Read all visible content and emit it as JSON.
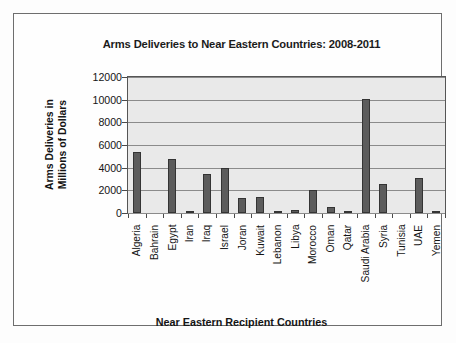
{
  "chart_data": {
    "type": "bar",
    "title": "Arms Deliveries to Near Eastern Countries: 2008-2011",
    "xlabel": "Near Eastern Recipient Countries",
    "ylabel": "Arms Deliveries in Millions of Dollars",
    "ylabel_line1": "Arms Deliveries in",
    "ylabel_line2": "Millions of Dollars",
    "ylim": [
      0,
      12000
    ],
    "ytick_step": 2000,
    "yticks": [
      "12000",
      "10000",
      "8000",
      "6000",
      "4000",
      "2000",
      "0"
    ],
    "ytick_values": [
      12000,
      10000,
      8000,
      6000,
      4000,
      2000,
      0
    ],
    "grid": true,
    "grid_axis": "y",
    "legend": false,
    "categories": [
      "Algeria",
      "Bahrain",
      "Egypt",
      "Iran",
      "Iraq",
      "Israel",
      "Joran",
      "Kuwait",
      "Lebanon",
      "Libya",
      "Morocco",
      "Oman",
      "Qatar",
      "Saudi Arabia",
      "Syria",
      "Tunisia",
      "UAE",
      "Yemen"
    ],
    "values": [
      5400,
      0,
      4750,
      200,
      3400,
      4000,
      1350,
      1450,
      200,
      300,
      2000,
      550,
      100,
      10100,
      2550,
      0,
      3100,
      200
    ],
    "bar_color": "#5c5c5c",
    "bar_border_color": "#343434",
    "plot_background": "#e9e9e9",
    "grid_color": "#8b8b8b",
    "axis_color": "#555555",
    "text_color": "#141414"
  }
}
